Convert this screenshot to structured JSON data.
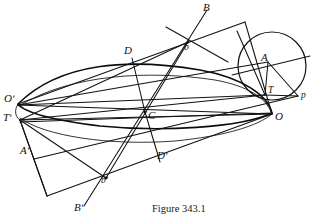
{
  "figure": {
    "caption": "Figure 343.1",
    "ink_color": "#111111",
    "background_color": "#ffffff",
    "width": 320,
    "height": 215
  },
  "labels": {
    "B": {
      "text": "B",
      "x": 203,
      "y": 2
    },
    "b": {
      "text": "b",
      "x": 184,
      "y": 43
    },
    "D": {
      "text": "D",
      "x": 124,
      "y": 45
    },
    "A": {
      "text": "A",
      "x": 261,
      "y": 52
    },
    "T": {
      "text": "T",
      "x": 268,
      "y": 86
    },
    "p": {
      "text": "p",
      "x": 301,
      "y": 91
    },
    "O": {
      "text": "O",
      "x": 275,
      "y": 111
    },
    "C": {
      "text": "C",
      "x": 148,
      "y": 110
    },
    "Oprime": {
      "text": "Oʹ",
      "x": 4,
      "y": 93
    },
    "Tprime": {
      "text": "Tʹ",
      "x": 3,
      "y": 112
    },
    "Aprime": {
      "text": "Aʹ",
      "x": 20,
      "y": 145
    },
    "Dprime": {
      "text": "Dʹ",
      "x": 157,
      "y": 150
    },
    "bprime": {
      "text": "bʹ",
      "x": 101,
      "y": 176
    },
    "Bprime": {
      "text": "Bʹ",
      "x": 74,
      "y": 202
    }
  },
  "points": {
    "O_prime": {
      "x": 18,
      "y": 105
    },
    "T_prime": {
      "x": 20,
      "y": 120
    },
    "C": {
      "x": 145,
      "y": 112
    },
    "O": {
      "x": 272,
      "y": 114
    },
    "T": {
      "x": 265,
      "y": 95
    },
    "A": {
      "x": 268,
      "y": 62
    },
    "A_prime": {
      "x": 34,
      "y": 159
    },
    "B": {
      "x": 207,
      "y": 10
    },
    "B_prime": {
      "x": 84,
      "y": 206
    },
    "b": {
      "x": 188,
      "y": 42
    },
    "b_prime": {
      "x": 106,
      "y": 178
    },
    "D": {
      "x": 132,
      "y": 58
    },
    "D_prime": {
      "x": 160,
      "y": 162
    },
    "p": {
      "x": 298,
      "y": 96
    },
    "corner_top_right": {
      "x": 245,
      "y": 22
    },
    "corner_bottom_left": {
      "x": 47,
      "y": 196
    },
    "circle_center": {
      "x": 272,
      "y": 66
    },
    "circle_radius": 34
  }
}
